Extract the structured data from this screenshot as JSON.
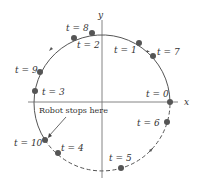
{
  "axes": {
    "x_label": "x",
    "y_label": "y"
  },
  "points": [
    {
      "label": "t = 0",
      "x": 170,
      "y": 102,
      "lx": 146,
      "ly": 97
    },
    {
      "label": "t = 1",
      "x": 139,
      "y": 43,
      "lx": 114,
      "ly": 53
    },
    {
      "label": "t = 2",
      "x": 74,
      "y": 38,
      "lx": 77,
      "ly": 48
    },
    {
      "label": "t = 3",
      "x": 35,
      "y": 91,
      "lx": 42,
      "ly": 95
    },
    {
      "label": "t = 4",
      "x": 58,
      "y": 153,
      "lx": 61,
      "ly": 151
    },
    {
      "label": "t = 5",
      "x": 121,
      "y": 168,
      "lx": 109,
      "ly": 161
    },
    {
      "label": "t = 6",
      "x": 167,
      "y": 122,
      "lx": 137,
      "ly": 126
    },
    {
      "label": "t = 7",
      "x": 153,
      "y": 56,
      "lx": 157,
      "ly": 55
    },
    {
      "label": "t = 8",
      "x": 92,
      "y": 33,
      "lx": 66,
      "ly": 31
    },
    {
      "label": "t = 9",
      "x": 40,
      "y": 72,
      "lx": 15,
      "ly": 73
    },
    {
      "label": "t = 10",
      "x": 45,
      "y": 140,
      "lx": 14,
      "ly": 146
    }
  ],
  "annotation": {
    "text": "Robot stops here"
  },
  "caption": {
    "text": "Figure"
  }
}
